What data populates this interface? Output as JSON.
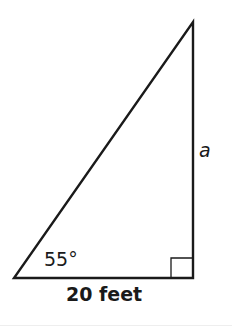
{
  "diagram": {
    "type": "right-triangle",
    "vertices": {
      "bottom_left": [
        14,
        278
      ],
      "bottom_right": [
        193,
        278
      ],
      "top": [
        193,
        22
      ]
    },
    "right_angle_marker": {
      "x": 171,
      "y": 258,
      "size": 20
    },
    "labels": {
      "angle": "55°",
      "vertical_side": "a",
      "base": "20 feet"
    },
    "colors": {
      "stroke": "#1a1a1a",
      "background": "#ffffff"
    }
  }
}
